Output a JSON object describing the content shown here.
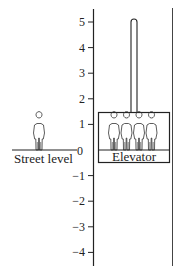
{
  "diagram": {
    "axis": {
      "ticks": [
        {
          "value": 5,
          "label": "5"
        },
        {
          "value": 4,
          "label": "4"
        },
        {
          "value": 3,
          "label": "3"
        },
        {
          "value": 2,
          "label": "2"
        },
        {
          "value": 1,
          "label": "1"
        },
        {
          "value": 0,
          "label": "0"
        },
        {
          "value": -1,
          "label": "−1"
        },
        {
          "value": -2,
          "label": "−2"
        },
        {
          "value": -3,
          "label": "−3"
        },
        {
          "value": -4,
          "label": "−4"
        }
      ],
      "range": [
        -4.5,
        5.5
      ]
    },
    "street": {
      "label": "Street level",
      "people_count": 1
    },
    "elevator": {
      "label": "Elevator",
      "people_count": 4,
      "cable_top_value": 5
    },
    "colors": {
      "line": "#222222",
      "background": "#ffffff"
    }
  }
}
